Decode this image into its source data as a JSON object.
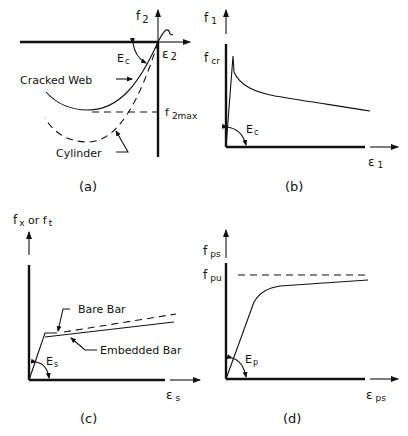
{
  "figure": {
    "panels": [
      {
        "id": "a",
        "caption": "(a)",
        "y_label": "f",
        "y_sub": "2",
        "x_label": "ε",
        "x_sub": "2",
        "modulus_label": "E",
        "modulus_sub": "c",
        "curve_labels": [
          "Cracked Web",
          "Cylinder"
        ],
        "peak_label": "f",
        "peak_sub": "2max"
      },
      {
        "id": "b",
        "caption": "(b)",
        "y_label": "f",
        "y_sub": "1",
        "x_label": "ε",
        "x_sub": "1",
        "modulus_label": "E",
        "modulus_sub": "c",
        "peak_label": "f",
        "peak_sub": "cr"
      },
      {
        "id": "c",
        "caption": "(c)",
        "y_label": "f",
        "y_sub": "x",
        "y_mid": " or f",
        "y_sub2": "t",
        "x_label": "ε",
        "x_sub": "s",
        "modulus_label": "E",
        "modulus_sub": "s",
        "curve_labels": [
          "Bare Bar",
          "Embedded Bar"
        ]
      },
      {
        "id": "d",
        "caption": "(d)",
        "y_label": "f",
        "y_sub": "ps",
        "x_label": "ε",
        "x_sub": "ps",
        "modulus_label": "E",
        "modulus_sub": "p",
        "peak_label": "f",
        "peak_sub": "pu"
      }
    ]
  }
}
